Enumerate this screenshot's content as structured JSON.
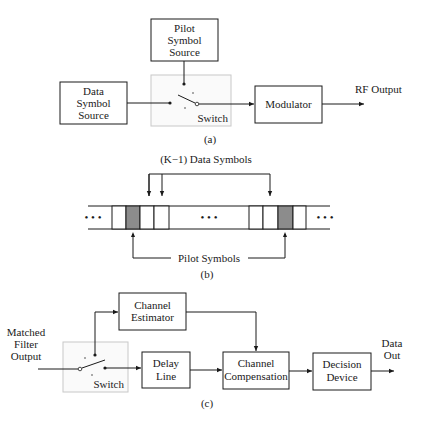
{
  "panel_a": {
    "caption": "(a)",
    "pilot_source": {
      "line1": "Pilot",
      "line2": "Symbol",
      "line3": "Source"
    },
    "data_source": {
      "line1": "Data",
      "line2": "Symbol",
      "line3": "Source"
    },
    "switch_label": "Switch",
    "modulator_label": "Modulator",
    "output_label": "RF Output"
  },
  "panel_b": {
    "caption": "(b)",
    "data_symbols_label": "(K−1) Data Symbols",
    "pilot_symbols_label": "Pilot Symbols",
    "ellipsis": "• • •",
    "colors": {
      "pilot_cell": "#8c8c8c"
    }
  },
  "panel_c": {
    "caption": "(c)",
    "input_label": {
      "line1": "Matched",
      "line2": "Filter",
      "line3": "Output"
    },
    "switch_label": "Switch",
    "channel_estimator": {
      "line1": "Channel",
      "line2": "Estimator"
    },
    "delay_line": {
      "line1": "Delay",
      "line2": "Line"
    },
    "channel_compensation": {
      "line1": "Channel",
      "line2": "Compensation"
    },
    "decision_device": {
      "line1": "Decision",
      "line2": "Device"
    },
    "output_label": {
      "line1": "Data",
      "line2": "Out"
    }
  }
}
